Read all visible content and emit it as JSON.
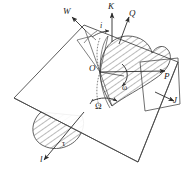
{
  "figure": {
    "type": "3d-vector-mechanics-diagram",
    "background_color": "#ffffff",
    "line_color": "#3a3a3a",
    "label_color": "#1a1a1a"
  },
  "labels": {
    "w": "W",
    "k": "K",
    "q": "Q",
    "i": "i",
    "o": "O",
    "p": "P",
    "omega_small": "ω",
    "omega_big": "Ω",
    "j": "J",
    "tau": "τ",
    "l": "l"
  }
}
